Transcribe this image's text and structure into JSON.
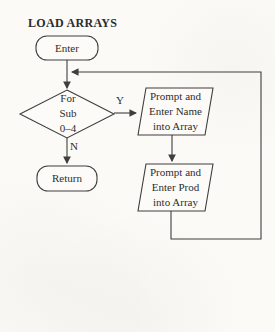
{
  "title": "LOAD ARRAYS",
  "nodes": {
    "enter": {
      "type": "terminal",
      "label": "Enter"
    },
    "decision": {
      "type": "decision",
      "label": "For\nSub\n0–4"
    },
    "io_name": {
      "type": "input-output",
      "label": "Prompt and\nEnter Name\ninto Array"
    },
    "io_prod": {
      "type": "input-output",
      "label": "Prompt and\nEnter Prod\ninto Array"
    },
    "return": {
      "type": "terminal",
      "label": "Return"
    }
  },
  "edges": {
    "yes_label": "Y",
    "no_label": "N"
  },
  "colors": {
    "ink": "#3e3e3e",
    "text": "#2e2e2e",
    "paper": "#fbfaf7"
  }
}
